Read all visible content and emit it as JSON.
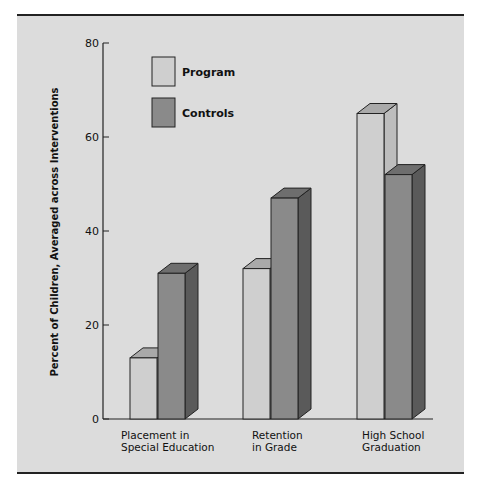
{
  "chart_data": {
    "type": "bar",
    "style": "3d-grouped",
    "title": "",
    "xlabel": "",
    "ylabel": "Percent of Children, Averaged across Interventions",
    "ylim": [
      0,
      80
    ],
    "yticks": [
      0,
      20,
      40,
      60,
      80
    ],
    "grid": false,
    "legend_position": "upper-left-inside",
    "categories": [
      "Placement in Special Education",
      "Retention in Grade",
      "High School Graduation"
    ],
    "category_lines": [
      [
        "Placement in",
        "Special Education"
      ],
      [
        "Retention",
        "in Grade"
      ],
      [
        "High School",
        "Graduation"
      ]
    ],
    "series": [
      {
        "name": "Program",
        "values": [
          13,
          32,
          65
        ],
        "color": "#cfcfcf"
      },
      {
        "name": "Controls",
        "values": [
          31,
          47,
          52
        ],
        "color": "#8a8a8a"
      }
    ]
  },
  "colors": {
    "background": "#dcdcdc",
    "program_front": "#cfcfcf",
    "program_top": "#a9a9a9",
    "program_side": "#bdbdbd",
    "controls_front": "#8a8a8a",
    "controls_top": "#6e6e6e",
    "controls_side": "#5a5a5a",
    "axis": "#222222"
  }
}
